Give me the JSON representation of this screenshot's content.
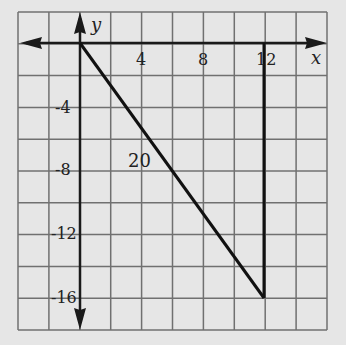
{
  "diagram": {
    "type": "coordinate-plane-triangle",
    "x_axis_label": "x",
    "y_axis_label": "y",
    "x_tick_labels": [
      {
        "value": 4,
        "text": "4"
      },
      {
        "value": 8,
        "text": "8"
      },
      {
        "value": 12,
        "text": "12"
      }
    ],
    "y_tick_labels": [
      {
        "value": -4,
        "text": "-4"
      },
      {
        "value": -8,
        "text": "-8"
      },
      {
        "value": -12,
        "text": "-12"
      },
      {
        "value": -16,
        "text": "-16"
      }
    ],
    "grid_unit": 2,
    "x_range": [
      -4,
      16
    ],
    "y_range": [
      -18,
      2
    ],
    "triangle_vertices": [
      [
        0,
        0
      ],
      [
        12,
        -16
      ],
      [
        12,
        0
      ]
    ],
    "hypotenuse_label": "20",
    "colors": {
      "background": "#e6e6e6",
      "grid": "#6e6e6e",
      "axis": "#1a1a1a",
      "line": "#111111"
    }
  }
}
